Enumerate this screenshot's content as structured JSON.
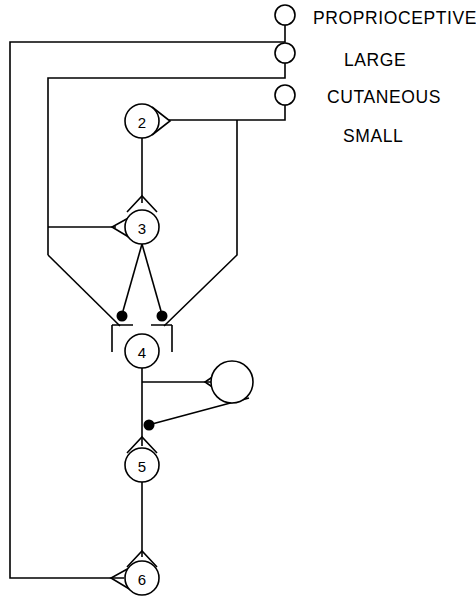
{
  "diagram": {
    "background_color": "#ffffff",
    "line_color": "#000000",
    "width": 476,
    "height": 604,
    "afferent_labels": [
      {
        "id": "proprioceptive",
        "text": "PROPRIOCEPTIVE",
        "x": 313,
        "y": 24
      },
      {
        "id": "large",
        "text": "LARGE",
        "x": 344,
        "y": 66
      },
      {
        "id": "cutaneous",
        "text": "CUTANEOUS",
        "x": 327,
        "y": 103
      },
      {
        "id": "small",
        "text": "SMALL",
        "x": 343,
        "y": 142
      }
    ],
    "afferent_terminals": [
      {
        "id": "terminal-proprioceptive",
        "cx": 285,
        "cy": 15,
        "r": 10,
        "stem_to": 42
      },
      {
        "id": "terminal-large",
        "cx": 285,
        "cy": 53,
        "r": 10,
        "stem_to": 78
      },
      {
        "id": "terminal-cutaneous",
        "cx": 285,
        "cy": 95,
        "r": 10,
        "stem_to": 120
      }
    ],
    "interneurons": [
      {
        "id": "neuron-2",
        "label": "2",
        "cx": 142,
        "cy": 121,
        "r": 17
      },
      {
        "id": "neuron-3",
        "label": "3",
        "cx": 142,
        "cy": 227,
        "r": 17
      },
      {
        "id": "neuron-4",
        "label": "4",
        "cx": 142,
        "cy": 351,
        "r": 17
      },
      {
        "id": "neuron-5",
        "label": "5",
        "cx": 142,
        "cy": 465,
        "r": 17
      },
      {
        "id": "neuron-6",
        "label": "6",
        "cx": 142,
        "cy": 578,
        "r": 17
      },
      {
        "id": "neuron-unlabeled",
        "label": "",
        "cx": 232,
        "cy": 382,
        "r": 21
      }
    ],
    "inhibitory_synapses": [
      {
        "id": "synapse-filled-left-neuron-4",
        "cx": 122,
        "cy": 316,
        "r": 5.5
      },
      {
        "id": "synapse-filled-right-neuron-4",
        "cx": 162,
        "cy": 316,
        "r": 5.5
      },
      {
        "id": "synapse-filled-neuron-5",
        "cx": 149,
        "cy": 425,
        "r": 5.5
      }
    ],
    "excitatory_synapses": [
      {
        "id": "synapse-open-neuron-2-axon",
        "orientation": "right"
      },
      {
        "id": "synapse-open-neuron-3-top",
        "orientation": "down"
      },
      {
        "id": "synapse-open-neuron-3-left",
        "orientation": "left"
      },
      {
        "id": "synapse-open-neuron-5-top",
        "orientation": "down"
      },
      {
        "id": "synapse-open-neuron-6-top",
        "orientation": "down"
      },
      {
        "id": "synapse-open-neuron-6-left",
        "orientation": "left"
      },
      {
        "id": "synapse-open-unlabeled-left",
        "orientation": "left"
      }
    ],
    "pathways": [
      {
        "id": "path-proprioceptive-feedback",
        "d": "M 285 25 L 285 42 L 10 42 L 10 578 L 124 578"
      },
      {
        "id": "path-large-feedback",
        "d": "M 285 63 L 285 78 L 48 78 L 48 255"
      },
      {
        "id": "path-cutaneous-to-neuron-2",
        "d": "M 285 105 L 285 120 L 167 120"
      },
      {
        "id": "path-neuron-2-axon",
        "d": "M 142 138 L 142 203"
      },
      {
        "id": "path-branch-down-right",
        "d": "M 237 120 L 237 255 L 163 325"
      },
      {
        "id": "path-branch-down-left",
        "d": "M 48 255 L 121 325"
      },
      {
        "id": "path-large-branch-to-neuron-3",
        "d": "M 48 227 L 118 227"
      },
      {
        "id": "path-neuron-3-axon-left",
        "d": "M 142 244 L 123 312"
      },
      {
        "id": "path-neuron-3-axon-right",
        "d": "M 142 244 L 161 312"
      },
      {
        "id": "path-neuron-4-axon",
        "d": "M 142 368 L 142 446"
      },
      {
        "id": "path-neuron-4-to-unlabeled",
        "d": "M 142 382 L 211 382"
      },
      {
        "id": "path-unlabeled-to-neuron-5",
        "d": "M 247 396 L 151 424"
      },
      {
        "id": "path-neuron-5-axon",
        "d": "M 142 482 L 142 557"
      }
    ],
    "synapse_geometry": {
      "neuron_2_axon_v": "M 152 107 L 170 121 L 152 135",
      "neuron_3_top_v": "M 128 211 L 142 196 L 156 211",
      "neuron_3_left_v": "M 131 217 L 113 227 L 131 238",
      "neuron_4_bracket": "M 112 325 L 133 325 M 151 325 L 172 325 M 112 325 L 112 352 M 172 325 L 172 352",
      "neuron_5_top_v": "M 128 455 L 142 440 L 156 455",
      "neuron_6_top_v": "M 128 568 L 142 553 L 156 568",
      "neuron_6_left_v": "M 130 568 L 112 578 L 130 589",
      "unlabeled_left_v": "M 226 368 L 206 382 L 226 396"
    }
  }
}
